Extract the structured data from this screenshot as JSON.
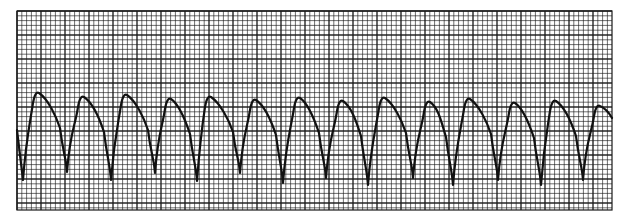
{
  "strip": {
    "title": "ECG rhythm strip",
    "background_color": "#ffffff",
    "grid_color": "#1a1a1a",
    "trace_color": "#111111"
  },
  "chart_data": {
    "type": "line",
    "title": "",
    "xlabel": "",
    "ylabel": "",
    "grid": true,
    "legend": null,
    "grid_spec": {
      "left_px": 17,
      "right_px": 612,
      "top_px": 11,
      "bottom_px": 210,
      "major_spacing_px": 24,
      "minor_spacing_px": 4.8,
      "major_columns": 25,
      "major_rows": 8
    },
    "complex_count": 14,
    "mean_cycle_length_px": 43,
    "trough_x_px": [
      23,
      67,
      111,
      155,
      197,
      240,
      283,
      326,
      368,
      413,
      453,
      498,
      541,
      583
    ],
    "trough_y_px": [
      180,
      172,
      180,
      173,
      181,
      173,
      183,
      178,
      185,
      178,
      185,
      180,
      185,
      180
    ],
    "peak_x_px": [
      36,
      81,
      124,
      168,
      208,
      253,
      297,
      340,
      382,
      427,
      467,
      512,
      553,
      597
    ],
    "peak_y_px": [
      93,
      97,
      95,
      99,
      97,
      100,
      98,
      101,
      98,
      102,
      99,
      103,
      101,
      106
    ],
    "trace_start": [
      17,
      130
    ],
    "trace_end": [
      612,
      118
    ]
  }
}
